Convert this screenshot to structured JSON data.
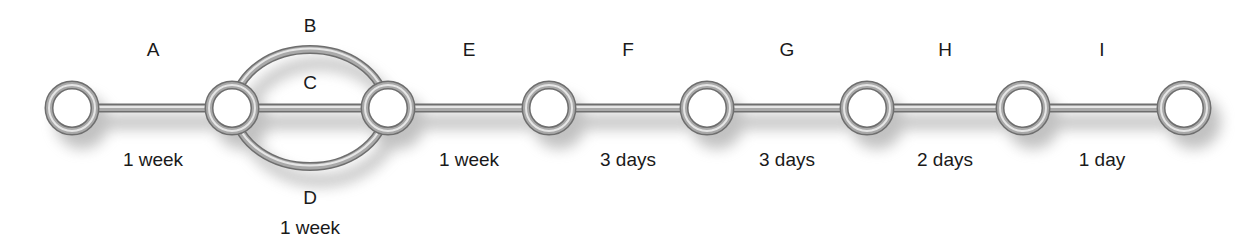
{
  "diagram": {
    "type": "network / activity-on-arrow schedule",
    "nodes": [
      {
        "id": "n1",
        "x": 72
      },
      {
        "id": "n2",
        "x": 232
      },
      {
        "id": "n3",
        "x": 388
      },
      {
        "id": "n4",
        "x": 549
      },
      {
        "id": "n5",
        "x": 707
      },
      {
        "id": "n6",
        "x": 867
      },
      {
        "id": "n7",
        "x": 1023
      },
      {
        "id": "n8",
        "x": 1184
      }
    ],
    "activities": [
      {
        "name": "A",
        "from": "n1",
        "to": "n2",
        "duration": "1 week"
      },
      {
        "name": "B",
        "from": "n2",
        "to": "n3",
        "duration": ""
      },
      {
        "name": "C",
        "from": "n2",
        "to": "n3",
        "duration": ""
      },
      {
        "name": "D",
        "from": "n2",
        "to": "n3",
        "duration": "1 week"
      },
      {
        "name": "E",
        "from": "n3",
        "to": "n4",
        "duration": "1 week"
      },
      {
        "name": "F",
        "from": "n4",
        "to": "n5",
        "duration": "3 days"
      },
      {
        "name": "G",
        "from": "n5",
        "to": "n6",
        "duration": "3 days"
      },
      {
        "name": "H",
        "from": "n6",
        "to": "n7",
        "duration": "2 days"
      },
      {
        "name": "I",
        "from": "n7",
        "to": "n8",
        "duration": "1 day"
      }
    ],
    "colors": {
      "ring": "#8a8a8a",
      "ring_highlight": "#e0e0e0",
      "ring_dark": "#5a5a5a",
      "shadow": "#9a9a9a",
      "text": "#1a1a1a"
    }
  },
  "labels": {
    "A": "A",
    "B": "B",
    "C": "C",
    "D": "D",
    "E": "E",
    "F": "F",
    "G": "G",
    "H": "H",
    "I": "I",
    "dur_A": "1 week",
    "dur_D": "1 week",
    "dur_E": "1 week",
    "dur_F": "3 days",
    "dur_G": "3 days",
    "dur_H": "2 days",
    "dur_I": "1 day"
  }
}
